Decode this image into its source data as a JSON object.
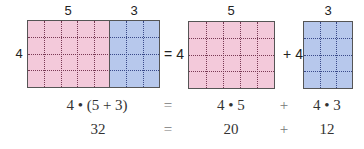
{
  "diagram": {
    "left_model": {
      "top_labels": [
        "5",
        "3"
      ],
      "side_label": "4",
      "pink_columns": 5,
      "blue_columns": 3,
      "rows": 4
    },
    "equals_label": "= 4",
    "middle_model": {
      "top_label": "5",
      "columns": 5,
      "rows": 4
    },
    "plus_label": "+ 4",
    "right_model": {
      "top_label": "3",
      "columns": 3,
      "rows": 4
    },
    "colors": {
      "pink": "#f3c9da",
      "blue": "#b7c8ec",
      "border": "#555555"
    }
  },
  "equations": {
    "row1": {
      "left": "4 • (5 + 3)",
      "eq": "=",
      "term1": "4 • 5",
      "op": "+",
      "term2": "4 • 3"
    },
    "row2": {
      "left": "32",
      "eq": "=",
      "term1": "20",
      "op": "+",
      "term2": "12"
    }
  }
}
